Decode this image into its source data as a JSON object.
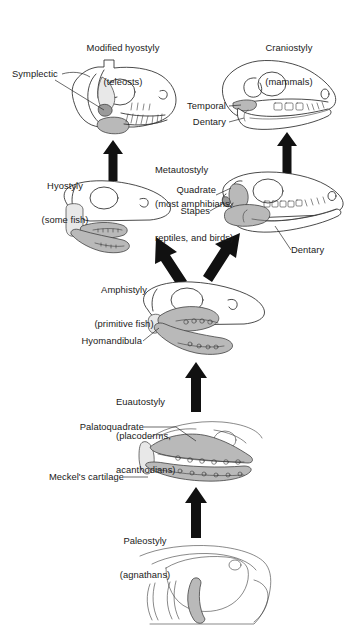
{
  "figure": {
    "type": "evolutionary-diagram",
    "background": "#ffffff",
    "ink_color": "#2b2b2b",
    "shade_color": "#b9b9b9"
  },
  "stages": [
    {
      "id": "modified-hyostyly",
      "name": "Modified hyostyly",
      "group": "(teleosts)",
      "position": "top-left"
    },
    {
      "id": "craniostyly",
      "name": "Craniostyly",
      "group": "(mammals)",
      "position": "top-right"
    },
    {
      "id": "hyostyly",
      "name": "Hyostyly",
      "group": "(some fish)",
      "position": "upper-middle-left"
    },
    {
      "id": "metautostyly",
      "name": "Metautostyly",
      "group": "(most amphibians,\nreptiles, and birds)",
      "position": "upper-middle-right"
    },
    {
      "id": "amphistyly",
      "name": "Amphistyly",
      "group": "(primitive fish)",
      "position": "middle"
    },
    {
      "id": "euautostyly",
      "name": "Euautostyly",
      "group": "(placoderms,\nacanthodians)",
      "position": "lower-middle"
    },
    {
      "id": "paleostyly",
      "name": "Paleostyly",
      "group": "(agnathans)",
      "position": "bottom"
    }
  ],
  "labels": {
    "modified_hyostyly_l1": "Modified hyostyly",
    "modified_hyostyly_l2": "(teleosts)",
    "craniostyly_l1": "Craniostyly",
    "craniostyly_l2": "(mammals)",
    "symplectic": "Symplectic",
    "temporal": "Temporal",
    "dentary_top": "Dentary",
    "hyostyly_l1": "Hyostyly",
    "hyostyly_l2": "(some fish)",
    "metautostyly_l1": "Metautostyly",
    "metautostyly_l2": "(most amphibians,",
    "metautostyly_l3": "reptiles, and birds)",
    "quadrate": "Quadrate",
    "stapes": "Stapes",
    "dentary_mid": "Dentary",
    "amphistyly_l1": "Amphistyly",
    "amphistyly_l2": "(primitive fish)",
    "hyomandibula": "Hyomandibula",
    "euautostyly_l1": "Euautostyly",
    "euautostyly_l2": "(placoderms,",
    "euautostyly_l3": "acanthodians)",
    "palatoquadrate": "Palatoquadrate",
    "meckels_cartilage": "Meckel's cartilage",
    "paleostyly_l1": "Paleostyly",
    "paleostyly_l2": "(agnathans)"
  },
  "anatomy_callouts": [
    {
      "label": "Symplectic",
      "skull": "modified-hyostyly"
    },
    {
      "label": "Temporal",
      "skull": "craniostyly"
    },
    {
      "label": "Dentary",
      "skull": "craniostyly"
    },
    {
      "label": "Quadrate",
      "skull": "metautostyly"
    },
    {
      "label": "Stapes",
      "skull": "metautostyly"
    },
    {
      "label": "Dentary",
      "skull": "metautostyly"
    },
    {
      "label": "Hyomandibula",
      "skull": "amphistyly"
    },
    {
      "label": "Palatoquadrate",
      "skull": "euautostyly"
    },
    {
      "label": "Meckel's cartilage",
      "skull": "euautostyly"
    }
  ],
  "arrows": [
    {
      "id": "paleostyly-to-euautostyly",
      "direction": "up",
      "from": "paleostyly",
      "to": "euautostyly"
    },
    {
      "id": "euautostyly-to-amphistyly",
      "direction": "up",
      "from": "euautostyly",
      "to": "amphistyly"
    },
    {
      "id": "amphistyly-to-hyostyly",
      "direction": "up-left",
      "from": "amphistyly",
      "to": "hyostyly"
    },
    {
      "id": "amphistyly-to-metautostyly",
      "direction": "up-right",
      "from": "amphistyly",
      "to": "metautostyly"
    },
    {
      "id": "hyostyly-to-modified-hyostyly",
      "direction": "up",
      "from": "hyostyly",
      "to": "modified-hyostyly"
    },
    {
      "id": "metautostyly-to-craniostyly",
      "direction": "up",
      "from": "metautostyly",
      "to": "craniostyly"
    }
  ]
}
